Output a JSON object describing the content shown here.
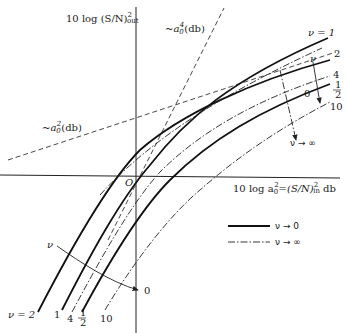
{
  "figure": {
    "y_axis_label": "10 log (S/N)",
    "y_axis_sup": "2",
    "y_axis_sub": "out",
    "x_axis_label": "10 log a",
    "x_axis_label_rest": "=(S/N)",
    "x_axis_sup": "2",
    "x_axis_sub": "in",
    "x_axis_unit": "db",
    "origin_label": "O",
    "asymptote_a2": "~a",
    "asymptote_a2_suffix": "(db)",
    "asymptote_a2_sup": "2",
    "asymptote_a4": "~a",
    "asymptote_a4_suffix": "(db)",
    "asymptote_a4_sup": "4",
    "sub0": "0"
  },
  "curves": {
    "top_labels": {
      "nu1": "ν = 1",
      "nu2": "2",
      "nu4": "4",
      "nu_half_num": "1",
      "nu_half_den": "2",
      "nu0": "0",
      "nu10": "10",
      "nu_arrow": "ν"
    },
    "bottom_labels": {
      "nu2": "ν = 2",
      "nu1": "1",
      "nu4": "4",
      "nu_half_num": "1",
      "nu_half_den": "2",
      "nu10": "10",
      "nu_arrow": "ν",
      "nu0": "0"
    },
    "nu_inf_arrow": "ν → ∞"
  },
  "legend": {
    "items": [
      {
        "style": "solid",
        "label": "ν → 0"
      },
      {
        "style": "dash-dot",
        "label": "ν → ∞"
      }
    ]
  }
}
